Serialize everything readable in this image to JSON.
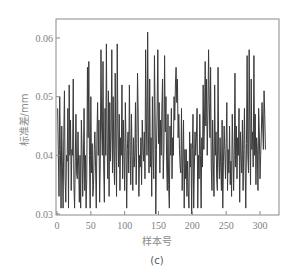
{
  "chart_data": {
    "type": "line",
    "title": "",
    "caption": "(c)",
    "xlabel": "样本号",
    "ylabel": "标准差/mm",
    "xlim": [
      0,
      320
    ],
    "ylim": [
      0.03,
      0.062
    ],
    "xticks": [
      0,
      50,
      100,
      150,
      200,
      250,
      300
    ],
    "yticks": [
      0.03,
      0.04,
      0.05,
      0.06
    ],
    "ytick_labels": [
      "0.03",
      "0.04",
      "0.05",
      "0.06"
    ],
    "grid": false,
    "legend": null,
    "series": [
      {
        "name": "标准差",
        "color": "#3a3a3a",
        "values": [
          0.048,
          0.04,
          0.033,
          0.05,
          0.041,
          0.031,
          0.045,
          0.038,
          0.031,
          0.043,
          0.051,
          0.036,
          0.032,
          0.04,
          0.039,
          0.048,
          0.031,
          0.052,
          0.04,
          0.046,
          0.034,
          0.041,
          0.04,
          0.053,
          0.035,
          0.031,
          0.039,
          0.047,
          0.037,
          0.036,
          0.044,
          0.038,
          0.032,
          0.04,
          0.031,
          0.046,
          0.041,
          0.033,
          0.039,
          0.048,
          0.034,
          0.04,
          0.031,
          0.036,
          0.055,
          0.043,
          0.056,
          0.04,
          0.031,
          0.05,
          0.037,
          0.042,
          0.033,
          0.035,
          0.041,
          0.044,
          0.038,
          0.031,
          0.043,
          0.049,
          0.04,
          0.046,
          0.032,
          0.039,
          0.058,
          0.045,
          0.04,
          0.056,
          0.038,
          0.032,
          0.048,
          0.04,
          0.059,
          0.042,
          0.036,
          0.051,
          0.033,
          0.049,
          0.039,
          0.044,
          0.058,
          0.037,
          0.05,
          0.04,
          0.035,
          0.054,
          0.041,
          0.033,
          0.059,
          0.045,
          0.038,
          0.047,
          0.034,
          0.043,
          0.04,
          0.052,
          0.036,
          0.046,
          0.04,
          0.034,
          0.049,
          0.042,
          0.031,
          0.041,
          0.044,
          0.037,
          0.052,
          0.041,
          0.035,
          0.047,
          0.04,
          0.034,
          0.043,
          0.038,
          0.04,
          0.049,
          0.035,
          0.042,
          0.054,
          0.047,
          0.033,
          0.04,
          0.038,
          0.043,
          0.035,
          0.046,
          0.041,
          0.039,
          0.044,
          0.036,
          0.058,
          0.046,
          0.04,
          0.061,
          0.044,
          0.037,
          0.053,
          0.038,
          0.043,
          0.033,
          0.05,
          0.04,
          0.036,
          0.057,
          0.047,
          0.03,
          0.041,
          0.048,
          0.058,
          0.042,
          0.049,
          0.037,
          0.046,
          0.04,
          0.048,
          0.053,
          0.036,
          0.041,
          0.057,
          0.044,
          0.05,
          0.039,
          0.034,
          0.047,
          0.035,
          0.031,
          0.045,
          0.04,
          0.048,
          0.036,
          0.043,
          0.04,
          0.05,
          0.046,
          0.052,
          0.055,
          0.049,
          0.053,
          0.043,
          0.047,
          0.041,
          0.038,
          0.037,
          0.048,
          0.034,
          0.04,
          0.046,
          0.031,
          0.041,
          0.036,
          0.041,
          0.033,
          0.039,
          0.034,
          0.031,
          0.044,
          0.038,
          0.042,
          0.03,
          0.041,
          0.047,
          0.031,
          0.038,
          0.044,
          0.04,
          0.043,
          0.048,
          0.031,
          0.04,
          0.036,
          0.047,
          0.04,
          0.031,
          0.043,
          0.038,
          0.052,
          0.041,
          0.046,
          0.056,
          0.045,
          0.053,
          0.04,
          0.047,
          0.058,
          0.049,
          0.043,
          0.055,
          0.038,
          0.034,
          0.046,
          0.039,
          0.033,
          0.052,
          0.04,
          0.044,
          0.036,
          0.034,
          0.055,
          0.04,
          0.036,
          0.043,
          0.038,
          0.034,
          0.046,
          0.031,
          0.039,
          0.045,
          0.041,
          0.036,
          0.042,
          0.049,
          0.034,
          0.041,
          0.037,
          0.045,
          0.035,
          0.039,
          0.033,
          0.047,
          0.041,
          0.034,
          0.04,
          0.054,
          0.038,
          0.045,
          0.036,
          0.043,
          0.04,
          0.048,
          0.032,
          0.044,
          0.04,
          0.037,
          0.046,
          0.034,
          0.041,
          0.048,
          0.038,
          0.031,
          0.042,
          0.057,
          0.04,
          0.037,
          0.058,
          0.044,
          0.035,
          0.053,
          0.041,
          0.044,
          0.038,
          0.057,
          0.04,
          0.047,
          0.035,
          0.043,
          0.041,
          0.034,
          0.048,
          0.044,
          0.036,
          0.04,
          0.044,
          0.049,
          0.045,
          0.041,
          0.051,
          0.047,
          0.041
        ]
      }
    ]
  }
}
